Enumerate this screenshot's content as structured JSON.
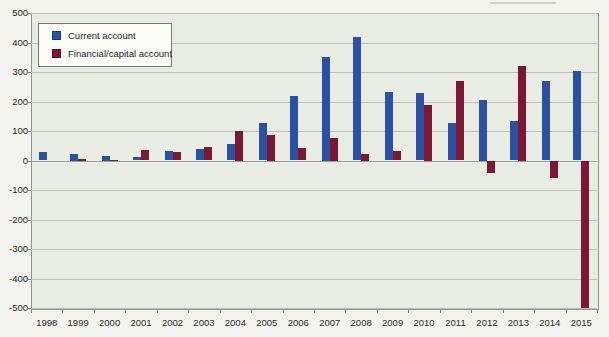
{
  "chart_data": {
    "type": "bar",
    "title": "",
    "categories": [
      "1998",
      "1999",
      "2000",
      "2001",
      "2002",
      "2003",
      "2004",
      "2005",
      "2006",
      "2007",
      "2008",
      "2009",
      "2010",
      "2011",
      "2012",
      "2013",
      "2014",
      "2015"
    ],
    "series": [
      {
        "name": "Current account",
        "color": "#2b52a2",
        "values": [
          30,
          22,
          17,
          13,
          32,
          40,
          55,
          126,
          220,
          350,
          418,
          233,
          228,
          128,
          205,
          133,
          270,
          303
        ]
      },
      {
        "name": "Financial/capital account",
        "color": "#7c1834",
        "values": [
          0,
          5,
          2,
          35,
          30,
          45,
          100,
          88,
          42,
          78,
          22,
          31,
          188,
          268,
          -42,
          322,
          -58,
          -500
        ]
      }
    ],
    "xlabel": "",
    "ylabel": "",
    "ylim": [
      -500,
      500
    ],
    "ytick_step": 100,
    "ytick_labels": [
      "500",
      "400",
      "300",
      "200",
      "100",
      "0",
      "-100",
      "-200",
      "-300",
      "-400",
      "-500"
    ],
    "grid": true,
    "legend_position": "top-left-inside",
    "plot_background": "#e8ece2",
    "page_background": "#f3f4ef",
    "gridline_color": "#bcc1b4",
    "axis_text_color": "#2b2b2b"
  }
}
